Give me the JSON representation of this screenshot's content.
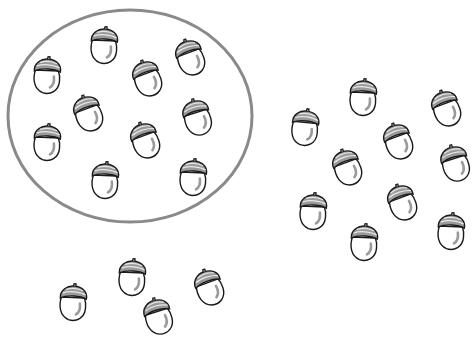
{
  "scene": {
    "description": "Acorn counting picture: a group of acorns circled, plus more acorns outside",
    "background": "#ffffff",
    "circle": {
      "cx": 130,
      "cy": 116,
      "rx": 122,
      "ry": 106,
      "stroke": "#8a8a8a",
      "stroke_width": 3
    },
    "colors": {
      "outline": "#1a1a1a",
      "cap_fill": "#9a9a9a",
      "cap_stripe": "#e8e8e8",
      "highlight": "#9a9a9a",
      "body_fill": "#ffffff"
    },
    "groups": [
      {
        "name": "circled-group",
        "count": 10,
        "acorns": [
          {
            "x": 104,
            "y": 45,
            "rot": 5
          },
          {
            "x": 190,
            "y": 57,
            "rot": -18
          },
          {
            "x": 47,
            "y": 75,
            "rot": 5
          },
          {
            "x": 147,
            "y": 78,
            "rot": -18
          },
          {
            "x": 88,
            "y": 113,
            "rot": -18
          },
          {
            "x": 197,
            "y": 117,
            "rot": -15
          },
          {
            "x": 47,
            "y": 142,
            "rot": 5
          },
          {
            "x": 145,
            "y": 140,
            "rot": -18
          },
          {
            "x": 105,
            "y": 180,
            "rot": 5
          },
          {
            "x": 193,
            "y": 177,
            "rot": 5
          }
        ]
      },
      {
        "name": "right-group",
        "count": 10,
        "acorns": [
          {
            "x": 363,
            "y": 97,
            "rot": 5
          },
          {
            "x": 446,
            "y": 108,
            "rot": -18
          },
          {
            "x": 305,
            "y": 127,
            "rot": 8
          },
          {
            "x": 398,
            "y": 141,
            "rot": -18
          },
          {
            "x": 347,
            "y": 167,
            "rot": -18
          },
          {
            "x": 455,
            "y": 163,
            "rot": -15
          },
          {
            "x": 402,
            "y": 202,
            "rot": -18
          },
          {
            "x": 313,
            "y": 211,
            "rot": 5
          },
          {
            "x": 364,
            "y": 242,
            "rot": 5
          },
          {
            "x": 451,
            "y": 231,
            "rot": 5
          }
        ]
      },
      {
        "name": "bottom-group",
        "count_visible": 4,
        "acorns": [
          {
            "x": 132,
            "y": 277,
            "rot": 5
          },
          {
            "x": 209,
            "y": 287,
            "rot": -18
          },
          {
            "x": 73,
            "y": 302,
            "rot": 5
          },
          {
            "x": 158,
            "y": 316,
            "rot": -15
          }
        ]
      }
    ]
  }
}
